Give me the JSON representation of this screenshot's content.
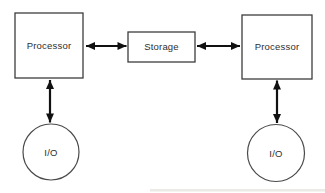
{
  "colors": {
    "background": "#ffffff",
    "box_border": "#3d3d3d",
    "circle_border": "#4a4a4a",
    "arrow": "#111111",
    "text": "#2e2e2e",
    "artifact": "#ddd9d2"
  },
  "nodes": {
    "processor_left": {
      "label": "Processor",
      "shape": "rect"
    },
    "storage": {
      "label": "Storage",
      "shape": "rect"
    },
    "processor_right": {
      "label": "Processor",
      "shape": "rect"
    },
    "io_left": {
      "label": "I/O",
      "shape": "circle"
    },
    "io_right": {
      "label": "I/O",
      "shape": "circle"
    }
  },
  "edges": [
    {
      "from": "processor_left",
      "to": "storage",
      "direction": "bidirectional",
      "orientation": "horizontal"
    },
    {
      "from": "storage",
      "to": "processor_right",
      "direction": "bidirectional",
      "orientation": "horizontal"
    },
    {
      "from": "processor_left",
      "to": "io_left",
      "direction": "bidirectional",
      "orientation": "vertical"
    },
    {
      "from": "processor_right",
      "to": "io_right",
      "direction": "bidirectional",
      "orientation": "vertical"
    }
  ]
}
